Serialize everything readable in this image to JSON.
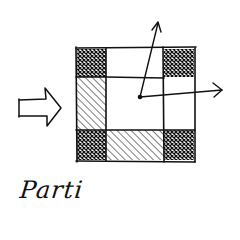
{
  "diagram": {
    "type": "architectural-parti-sketch",
    "caption": "Parti",
    "colors": {
      "ink": "#111111",
      "paper": "#ffffff"
    },
    "plan": {
      "outer": {
        "x": 76,
        "y": 48,
        "w": 119,
        "h": 113
      },
      "grid_x": [
        76,
        106,
        164,
        195
      ],
      "grid_y": [
        48,
        77,
        130,
        161
      ],
      "cells": [
        {
          "row": 0,
          "col": 0,
          "fill": "crosshatch"
        },
        {
          "row": 0,
          "col": 1,
          "fill": "empty"
        },
        {
          "row": 0,
          "col": 2,
          "fill": "crosshatch"
        },
        {
          "row": 1,
          "col": 0,
          "fill": "diagonal-hatch"
        },
        {
          "row": 1,
          "col": 1,
          "fill": "empty"
        },
        {
          "row": 1,
          "col": 2,
          "fill": "empty"
        },
        {
          "row": 2,
          "col": 0,
          "fill": "crosshatch"
        },
        {
          "row": 2,
          "col": 1,
          "fill": "diagonal-hatch"
        },
        {
          "row": 2,
          "col": 2,
          "fill": "crosshatch"
        }
      ]
    },
    "entry_arrow": {
      "direction": "right",
      "label": "entry"
    },
    "focal_point": {
      "x": 140,
      "y": 97
    },
    "view_arrows": [
      {
        "to_x": 158,
        "to_y": 22,
        "direction": "up"
      },
      {
        "to_x": 222,
        "to_y": 90,
        "direction": "right"
      }
    ]
  }
}
